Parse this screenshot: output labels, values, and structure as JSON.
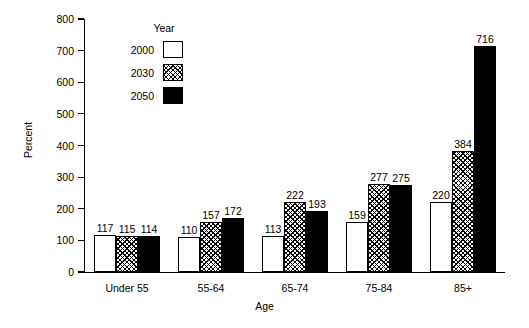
{
  "chart_data": {
    "type": "bar",
    "title": "",
    "subtitle": "",
    "xlabel": "Age",
    "ylabel": "Percent",
    "ylim": [
      0,
      800
    ],
    "ytick_values": [
      0,
      100,
      200,
      300,
      400,
      500,
      600,
      700,
      800
    ],
    "ytick_labels": [
      "0",
      "100",
      "200",
      "300",
      "400",
      "500",
      "600",
      "700",
      "800"
    ],
    "grid": false,
    "categories": [
      "Under 55",
      "55-64",
      "65-74",
      "75-84",
      "85+"
    ],
    "legend": {
      "title": "Year",
      "position": "upper-left-inside",
      "entries": [
        {
          "name": "2000",
          "pattern": "solid-white",
          "color": "#ffffff"
        },
        {
          "name": "2030",
          "pattern": "crosshatch",
          "color": "#000000"
        },
        {
          "name": "2050",
          "pattern": "solid-black",
          "color": "#000000"
        }
      ]
    },
    "series": [
      {
        "name": "2000",
        "values": [
          117,
          110,
          113,
          159,
          220
        ]
      },
      {
        "name": "2030",
        "values": [
          115,
          157,
          222,
          277,
          384
        ]
      },
      {
        "name": "2050",
        "values": [
          114,
          172,
          193,
          275,
          716
        ]
      }
    ],
    "data_labels": [
      [
        "117",
        "115",
        "114"
      ],
      [
        "110",
        "157",
        "172"
      ],
      [
        "113",
        "222",
        "193"
      ],
      [
        "159",
        "277",
        "275"
      ],
      [
        "220",
        "384",
        "716"
      ]
    ]
  },
  "colors": {
    "background": "#ffffff",
    "axis": "#000000",
    "text": "#000000",
    "series_2000": "#ffffff",
    "series_2030": "#000000",
    "series_2050": "#000000"
  }
}
